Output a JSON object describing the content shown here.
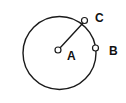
{
  "figure": {
    "name": "circle-with-radius-and-points",
    "background_color": "#ffffff",
    "stroke_color": "#1a1a1a",
    "label_color": "#111111",
    "marker_fill": "#ffffff",
    "width": 126,
    "height": 103
  },
  "circle": {
    "name": "main-circle",
    "center_x": 59.5,
    "center_y": 53,
    "radius": 36.5,
    "stroke_width": 1.4
  },
  "points": [
    {
      "id": "A",
      "label": "A",
      "role": "center",
      "x": 58,
      "y": 50,
      "marker_radius": 3,
      "label_x": 67,
      "label_y": 57
    },
    {
      "id": "C",
      "label": "C",
      "role": "on-circle",
      "x": 84.5,
      "y": 20.5,
      "marker_radius": 3,
      "label_x": 95,
      "label_y": 19
    },
    {
      "id": "B",
      "label": "B",
      "role": "on-circle",
      "x": 95.5,
      "y": 48,
      "marker_radius": 3,
      "label_x": 109,
      "label_y": 52
    }
  ],
  "segments": [
    {
      "id": "AC",
      "name": "radius-segment-a-to-c",
      "from": "A",
      "to": "C",
      "x1": 59.5,
      "y1": 48.5,
      "x2": 83.5,
      "y2": 22.5,
      "stroke_width": 1.4
    }
  ]
}
